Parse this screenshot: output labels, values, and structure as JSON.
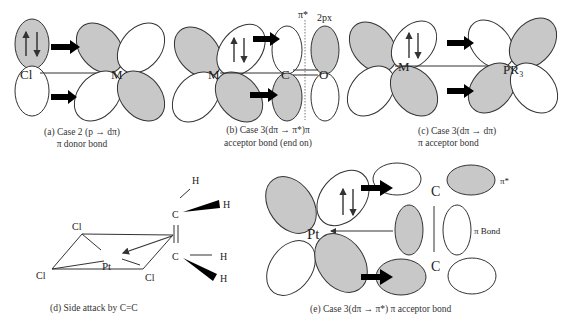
{
  "panels": {
    "a": {
      "atoms": {
        "left": "Cl",
        "right": "M"
      },
      "caption_line1": "(a) Case 2 (p → dπ)",
      "caption_line2": "π donor bond"
    },
    "b": {
      "atoms": {
        "metal": "M",
        "carbon": "C",
        "oxygen": "O"
      },
      "orbital_labels": {
        "pi_star": "π*",
        "two_px": "2px"
      },
      "caption_line1": "(b) Case 3(dπ → π*)π",
      "caption_line2": "acceptor bond (end on)"
    },
    "c": {
      "atoms": {
        "metal": "M",
        "ligand": "PR₃"
      },
      "caption_line1": "(c) Case 3(dπ → dπ)",
      "caption_line2": "π acceptor bond"
    },
    "d": {
      "atoms": {
        "metal": "Pt",
        "cl_top": "Cl",
        "cl_left": "Cl",
        "cl_right": "Cl",
        "c_top": "C",
        "c_bottom": "C",
        "h1": "H",
        "h2": "H",
        "h3": "H",
        "h4": "H"
      },
      "caption": "(d) Side attack by C=C"
    },
    "e": {
      "atoms": {
        "metal": "Pt",
        "c_top": "C",
        "c_bottom": "C"
      },
      "orbital_labels": {
        "pi_star": "π*",
        "pi_bond": "π Bond"
      },
      "caption": "(e) Case 3(dπ → π*) π acceptor bond"
    }
  },
  "colors": {
    "shaded_lobe": "#c8c8c8",
    "outline": "#333333",
    "background": "#ffffff"
  }
}
